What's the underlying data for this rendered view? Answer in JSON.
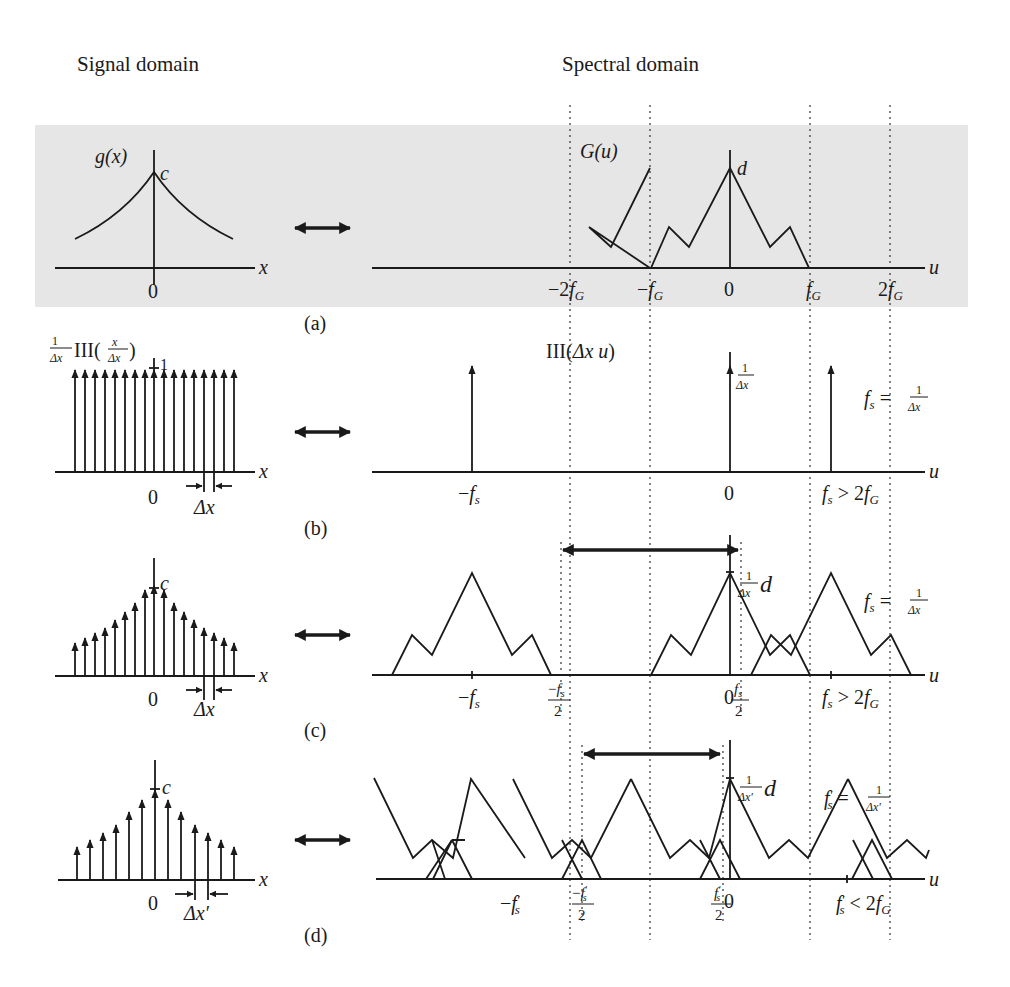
{
  "figure": {
    "headers": {
      "signal": "Signal domain",
      "spectral": "Spectral domain"
    },
    "panels": [
      {
        "id": "a",
        "caption": "(a)",
        "signal": {
          "function_label": "g(x)",
          "peak_label": "c",
          "axis_label": "x",
          "origin_label": "0"
        },
        "spectrum": {
          "function_label": "G(u)",
          "peak_label": "d",
          "axis_label": "u",
          "ticks": [
            "−2f",
            "−f",
            "0",
            "f",
            "2f"
          ],
          "tick_subscript": "G"
        }
      },
      {
        "id": "b",
        "caption": "(b)",
        "signal": {
          "function_label_prefix": "1/Δx",
          "function_label": "III(x/Δx)",
          "unit_label": "1",
          "axis_label": "x",
          "origin_label": "0",
          "spacing_label": "Δx"
        },
        "spectrum": {
          "function_label": "III(Δx u)",
          "impulse_label": "1/Δx",
          "axis_label": "u",
          "ticks": [
            "−f_s",
            "0",
            "f_s > 2f_G"
          ],
          "relation": "f_s = 1/Δx"
        }
      },
      {
        "id": "c",
        "caption": "(c)",
        "signal": {
          "peak_label": "c",
          "axis_label": "x",
          "origin_label": "0",
          "spacing_label": "Δx"
        },
        "spectrum": {
          "peak_label": "(1/Δx) d",
          "axis_label": "u",
          "ticks": [
            "−f_s",
            "−f_s/2",
            "0",
            "f_s/2",
            "f_s > 2f_G"
          ],
          "relation": "f_s = 1/Δx"
        }
      },
      {
        "id": "d",
        "caption": "(d)",
        "signal": {
          "peak_label": "c",
          "axis_label": "x",
          "origin_label": "0",
          "spacing_label": "Δx′"
        },
        "spectrum": {
          "peak_label": "(1/Δx′) d",
          "axis_label": "u",
          "ticks": [
            "−f′_s",
            "−f′_s/2",
            "0",
            "f′_s/2",
            "f′_s < 2f_G"
          ],
          "relation": "f′_s = 1/Δx′"
        }
      }
    ],
    "text": {
      "c": "c",
      "d": "d",
      "x": "x",
      "u": "u",
      "zero": "0",
      "one": "1",
      "gx": "g(x)",
      "Gu": "G(u)",
      "III": "III",
      "dx": "Δx",
      "dxp": "Δx′",
      "minus": "−",
      "two": "2",
      "f": "f",
      "s": "s",
      "G": "G",
      "prime": "′",
      "gt2fG": "> 2",
      "lt2fG": "< 2",
      "eq": "="
    },
    "colors": {
      "band": "#e6e6e6",
      "ink": "#1a1a1a"
    }
  }
}
